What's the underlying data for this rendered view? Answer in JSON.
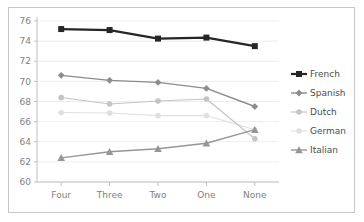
{
  "chart_data": {
    "type": "line",
    "title": "",
    "subtitle": "",
    "xlabel": "",
    "ylabel": "",
    "categories": [
      "Four",
      "Three",
      "Two",
      "One",
      "None"
    ],
    "ylim": [
      60,
      76
    ],
    "yticks": [
      60,
      62,
      64,
      66,
      68,
      70,
      72,
      74,
      76
    ],
    "ytick_labels": [
      "60",
      "62",
      "64",
      "66",
      "68",
      "70",
      "72",
      "74",
      "76"
    ],
    "grid": "horizontal",
    "legend_position": "right",
    "series": [
      {
        "name": "French",
        "values": [
          75.2,
          75.1,
          74.25,
          74.35,
          73.5
        ],
        "color": "#262626",
        "marker": "square",
        "line_width": 2.2
      },
      {
        "name": "Spanish",
        "values": [
          70.6,
          70.1,
          69.9,
          69.3,
          67.5
        ],
        "color": "#8c8c8c",
        "marker": "diamond",
        "line_width": 1.4
      },
      {
        "name": "Dutch",
        "values": [
          68.4,
          67.75,
          68.05,
          68.25,
          64.3
        ],
        "color": "#c4c4c4",
        "marker": "circle",
        "line_width": 1.2
      },
      {
        "name": "German",
        "values": [
          66.9,
          66.85,
          66.6,
          66.6,
          65.2
        ],
        "color": "#e0e0e0",
        "marker": "circle",
        "line_width": 1.1
      },
      {
        "name": "Italian",
        "values": [
          62.4,
          63.0,
          63.3,
          63.85,
          65.2
        ],
        "color": "#969696",
        "marker": "triangle",
        "line_width": 1.4
      }
    ]
  },
  "legend": {
    "items": [
      {
        "label": "French"
      },
      {
        "label": "Spanish"
      },
      {
        "label": "Dutch"
      },
      {
        "label": "German"
      },
      {
        "label": "Italian"
      }
    ]
  },
  "axis": {
    "y_tick_labels": [
      "76",
      "74",
      "72",
      "70",
      "68",
      "66",
      "64",
      "62",
      "60"
    ],
    "x_tick_labels": [
      "Four",
      "Three",
      "Two",
      "One",
      "None"
    ]
  }
}
